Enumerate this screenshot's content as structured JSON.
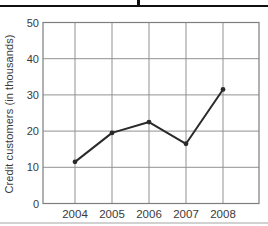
{
  "figure": {
    "background": "#ffffff",
    "top_rule_color": "#101010",
    "bottom_rule_color": "#c9c9c9"
  },
  "chart_data": {
    "type": "line",
    "title": "",
    "categories": [
      "2004",
      "2005",
      "2006",
      "2007",
      "2008"
    ],
    "series": [
      {
        "name": "Credit customers",
        "values": [
          11.5,
          19.5,
          22.5,
          16.5,
          31.5
        ]
      }
    ],
    "xlabel": "",
    "ylabel": "Credit customers (in thousands)",
    "ylim": [
      0,
      50
    ],
    "yticks": [
      0,
      10,
      20,
      30,
      40,
      50
    ],
    "grid": true,
    "legend_position": "none",
    "colors": {
      "line": "#2a2a2a",
      "marker": "#2a2a2a",
      "grid": "#919191",
      "plot_border": "#7e7e7e",
      "tick_text": "#3a3a3a"
    }
  }
}
